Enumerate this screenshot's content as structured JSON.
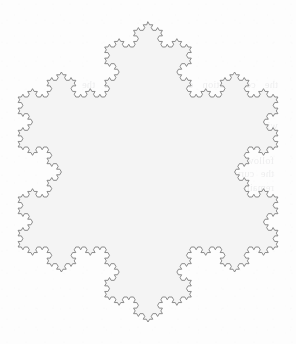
{
  "page": {
    "background_color": "#fdfdfd",
    "width": 296,
    "height": 344
  },
  "figure": {
    "name": "Koch snowflake",
    "fill_color": "#f4f4f4",
    "stroke_color": "#808080",
    "stroke_width": 0.9,
    "iterations": 4,
    "orientation": "vertex-up",
    "bounds": {
      "left": 18,
      "top": 20,
      "right": 278,
      "bottom": 320
    },
    "center": {
      "x": 148,
      "y": 172
    },
    "circumradius": 150
  },
  "bleed_text": {
    "note": "Illegible mirror-image show-through from the reverse side of the scanned page",
    "paragraph_top": "the construction of the curve and the resulting measure converges to a finite limit while the total boundary length increases without bound",
    "paragraph_mid": "such a figure is nowhere differentiable and it follows that no tangent line exists at any point of the curve although the region enclosed by it remains bounded and has a well defined area in the ordinary sense of the term"
  },
  "chart_data": {
    "type": "line",
    "subtitle": "von Koch curve applied to each side of an equilateral triangle",
    "xlabel": "",
    "ylabel": "",
    "generator": {
      "base_shape": "equilateral triangle",
      "sides": 3,
      "iterations": 4,
      "segments_per_side": 256,
      "total_segments": 768,
      "scaling_factor": 0.3333333333,
      "bump_angle_degrees": 60,
      "fractal_dimension": 1.2619,
      "orientation_degrees": -90
    },
    "axis": {
      "center_x": 148,
      "center_y": 172,
      "circumradius": 150,
      "xlim": [
        0,
        296
      ],
      "ylim": [
        344,
        0
      ],
      "grid": false
    },
    "legend": {
      "entries": [],
      "position": "none"
    },
    "style": {
      "fill": "#f4f4f4",
      "stroke": "#808080",
      "stroke_width": 0.9
    },
    "base_triangle_vertices": [
      {
        "x": 148.0,
        "y": 22.0
      },
      {
        "x": 277.9,
        "y": 247.0
      },
      {
        "x": 18.1,
        "y": 247.0
      }
    ]
  }
}
